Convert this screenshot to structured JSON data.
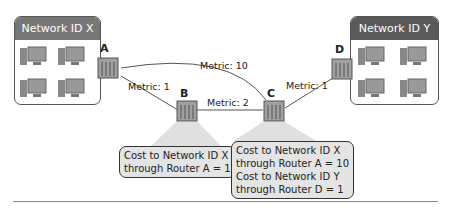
{
  "networks": {
    "x": {
      "label": "Network ID X",
      "header_color": "#777777",
      "computers": 4
    },
    "y": {
      "label": "Network ID Y",
      "header_color": "#5a5a5a",
      "computers": 4
    }
  },
  "routers": [
    {
      "id": "A",
      "label": "A"
    },
    {
      "id": "B",
      "label": "B"
    },
    {
      "id": "C",
      "label": "C"
    },
    {
      "id": "D",
      "label": "D"
    }
  ],
  "links": [
    {
      "from": "A",
      "to": "C",
      "label": "Metric: 10"
    },
    {
      "from": "A",
      "to": "B",
      "label": "Metric: 1"
    },
    {
      "from": "B",
      "to": "C",
      "label": "Metric: 2"
    },
    {
      "from": "C",
      "to": "D",
      "label": "Metric: 1"
    }
  ],
  "callouts": {
    "b": {
      "lines": [
        "Cost to Network ID X",
        "through Router A = 1"
      ]
    },
    "c": {
      "lines": [
        "Cost to Network ID X",
        "through Router A = 10",
        "Cost to Network ID Y",
        "through Router D = 1"
      ]
    }
  },
  "colors": {
    "callout_bg": "#e4e4e4",
    "router": "#9a9a9a",
    "line": "#555555"
  }
}
